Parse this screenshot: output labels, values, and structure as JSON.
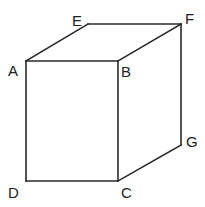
{
  "diagram": {
    "type": "cube",
    "vertices": {
      "A": {
        "label": "A",
        "x": 26,
        "y": 61
      },
      "B": {
        "label": "B",
        "x": 118,
        "y": 61
      },
      "C": {
        "label": "C",
        "x": 118,
        "y": 181
      },
      "D": {
        "label": "D",
        "x": 26,
        "y": 181
      },
      "E": {
        "label": "E",
        "x": 88,
        "y": 24
      },
      "F": {
        "label": "F",
        "x": 181,
        "y": 24
      },
      "G": {
        "label": "G",
        "x": 181,
        "y": 145
      }
    },
    "edges": [
      [
        "A",
        "B"
      ],
      [
        "B",
        "C"
      ],
      [
        "C",
        "D"
      ],
      [
        "D",
        "A"
      ],
      [
        "A",
        "E"
      ],
      [
        "E",
        "F"
      ],
      [
        "F",
        "B"
      ],
      [
        "F",
        "G"
      ],
      [
        "G",
        "C"
      ]
    ],
    "stroke_color": "#2a2a2a",
    "label_color": "#222222"
  }
}
